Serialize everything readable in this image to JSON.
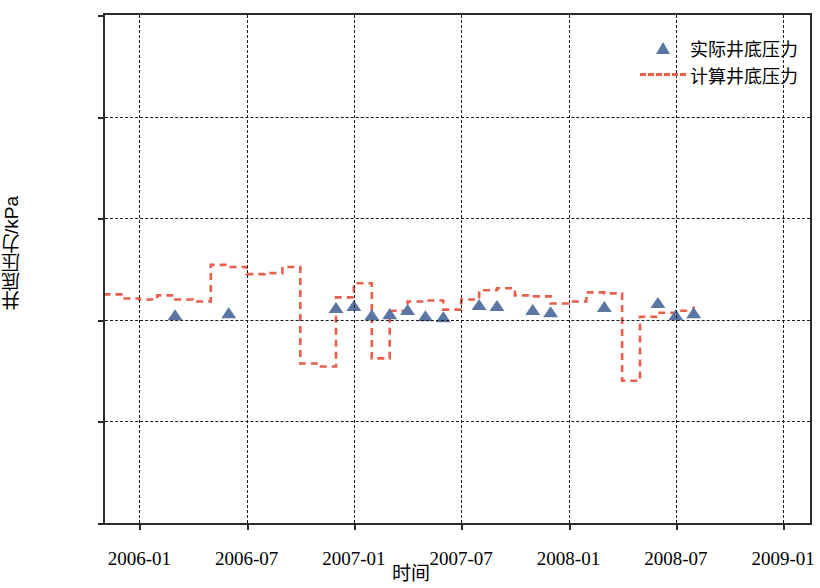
{
  "chart_data": {
    "type": "scatter",
    "title": "",
    "xlabel": "时间",
    "ylabel": "井底压力/kPa",
    "grid": true,
    "legend_position": "top-right",
    "xtick_labels": [
      "2006-01",
      "2006-07",
      "2007-01",
      "2007-07",
      "2008-01",
      "2008-07",
      "2009-01"
    ],
    "ytick_labels": [
      "0",
      "10 000",
      "20 000",
      "30 000",
      "40 000",
      "50 000"
    ],
    "ylim": [
      0,
      50000
    ],
    "xlim": [
      "2005-10",
      "2009-03"
    ],
    "colors": {
      "marker": "#5b76a3",
      "line": "#e8604c",
      "axis": "#2b2b2b",
      "grid": "#1a1a1a"
    },
    "series": [
      {
        "name": "实际井底压力",
        "style": "markers",
        "marker": "triangle",
        "color": "#5b76a3",
        "points": [
          {
            "x": "2006-03",
            "y": 20500
          },
          {
            "x": "2006-06",
            "y": 20700
          },
          {
            "x": "2006-12",
            "y": 21200
          },
          {
            "x": "2007-01",
            "y": 21400
          },
          {
            "x": "2007-02",
            "y": 20500
          },
          {
            "x": "2007-03",
            "y": 20600
          },
          {
            "x": "2007-04",
            "y": 21000
          },
          {
            "x": "2007-05",
            "y": 20400
          },
          {
            "x": "2007-06",
            "y": 20300
          },
          {
            "x": "2007-08",
            "y": 21500
          },
          {
            "x": "2007-09",
            "y": 21400
          },
          {
            "x": "2007-11",
            "y": 21000
          },
          {
            "x": "2007-12",
            "y": 20800
          },
          {
            "x": "2008-03",
            "y": 21300
          },
          {
            "x": "2008-06",
            "y": 21700
          },
          {
            "x": "2008-07",
            "y": 20500
          },
          {
            "x": "2008-08",
            "y": 20700
          }
        ]
      },
      {
        "name": "计算井底压力",
        "style": "dashed-line",
        "color": "#e8604c",
        "points": [
          {
            "x": "2005-11",
            "y": 22500
          },
          {
            "x": "2005-12",
            "y": 22100
          },
          {
            "x": "2006-01",
            "y": 22000
          },
          {
            "x": "2006-02",
            "y": 22400
          },
          {
            "x": "2006-03",
            "y": 22000
          },
          {
            "x": "2006-04",
            "y": 21800
          },
          {
            "x": "2006-05",
            "y": 25400
          },
          {
            "x": "2006-06",
            "y": 25200
          },
          {
            "x": "2006-07",
            "y": 24500
          },
          {
            "x": "2006-08",
            "y": 24600
          },
          {
            "x": "2006-09",
            "y": 25200
          },
          {
            "x": "2006-10",
            "y": 25100
          },
          {
            "x": "2006-10b",
            "y": 15700
          },
          {
            "x": "2006-11",
            "y": 15400
          },
          {
            "x": "2006-12",
            "y": 22200
          },
          {
            "x": "2007-01",
            "y": 22500
          },
          {
            "x": "2007-01b",
            "y": 23600
          },
          {
            "x": "2007-02",
            "y": 16300
          },
          {
            "x": "2007-02b",
            "y": 16200
          },
          {
            "x": "2007-03",
            "y": 20900
          },
          {
            "x": "2007-04",
            "y": 21800
          },
          {
            "x": "2007-05",
            "y": 21900
          },
          {
            "x": "2007-06",
            "y": 21000
          },
          {
            "x": "2007-07",
            "y": 22000
          },
          {
            "x": "2007-08",
            "y": 22900
          },
          {
            "x": "2007-09",
            "y": 23100
          },
          {
            "x": "2007-10",
            "y": 22400
          },
          {
            "x": "2007-11",
            "y": 22300
          },
          {
            "x": "2007-12",
            "y": 21600
          },
          {
            "x": "2008-01",
            "y": 21800
          },
          {
            "x": "2008-02",
            "y": 22700
          },
          {
            "x": "2008-03",
            "y": 22600
          },
          {
            "x": "2008-04",
            "y": 14000
          },
          {
            "x": "2008-05",
            "y": 20300
          },
          {
            "x": "2008-06",
            "y": 20700
          },
          {
            "x": "2008-07",
            "y": 20900
          },
          {
            "x": "2008-08",
            "y": 21300
          }
        ]
      }
    ]
  },
  "legend": {
    "entries": [
      {
        "label": "实际井底压力",
        "key": "triangle-marker"
      },
      {
        "label": "计算井底压力",
        "key": "dashed-line"
      }
    ]
  }
}
